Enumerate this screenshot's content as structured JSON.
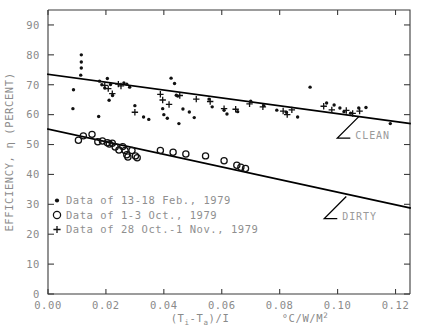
{
  "chart_data": {
    "type": "scatter",
    "title": "",
    "xlabel": "(Ti-Ta)/I",
    "xunits": "°C/W/M",
    "xunits_exp": "2",
    "ylabel": "EFFICIENCY, η (PERCENT)",
    "xlim": [
      0.0,
      0.125
    ],
    "ylim": [
      0,
      95
    ],
    "grid": false,
    "xticks": [
      0.0,
      0.02,
      0.04,
      0.06,
      0.08,
      0.1,
      0.12
    ],
    "xtick_labels": [
      "0.00",
      "0.02",
      "0.04",
      "0.06",
      "0.08",
      "0.10",
      "0.12"
    ],
    "yticks": [
      0,
      10,
      20,
      30,
      40,
      50,
      60,
      70,
      80,
      90
    ],
    "ytick_labels": [
      "0",
      "10",
      "20",
      "30",
      "40",
      "50",
      "60",
      "70",
      "80",
      "90"
    ],
    "legend_position": "lower-left-inside",
    "series": [
      {
        "name": "Data of 13-18 Feb., 1979",
        "marker": "filled-dot",
        "points": [
          [
            0.0115,
            80.0
          ],
          [
            0.0115,
            77.6
          ],
          [
            0.0115,
            75.6
          ],
          [
            0.0113,
            73.2
          ],
          [
            0.0088,
            68.3
          ],
          [
            0.0086,
            62.0
          ],
          [
            0.0178,
            71.2
          ],
          [
            0.0186,
            70.0
          ],
          [
            0.0196,
            68.9
          ],
          [
            0.0205,
            72.1
          ],
          [
            0.0216,
            70.1
          ],
          [
            0.0223,
            66.4
          ],
          [
            0.0211,
            64.8
          ],
          [
            0.0262,
            70.6
          ],
          [
            0.0272,
            70.2
          ],
          [
            0.0282,
            69.2
          ],
          [
            0.0175,
            59.4
          ],
          [
            0.03,
            63.0
          ],
          [
            0.0425,
            72.2
          ],
          [
            0.0437,
            70.4
          ],
          [
            0.0443,
            66.5
          ],
          [
            0.0396,
            62.0
          ],
          [
            0.04,
            60.0
          ],
          [
            0.0412,
            58.8
          ],
          [
            0.0452,
            57.0
          ],
          [
            0.0466,
            61.9
          ],
          [
            0.0488,
            60.9
          ],
          [
            0.0505,
            59.0
          ],
          [
            0.0448,
            66.2
          ],
          [
            0.0556,
            65.2
          ],
          [
            0.0567,
            62.6
          ],
          [
            0.0608,
            61.5
          ],
          [
            0.0618,
            60.2
          ],
          [
            0.0655,
            61.0
          ],
          [
            0.07,
            64.5
          ],
          [
            0.0745,
            63.0
          ],
          [
            0.079,
            61.5
          ],
          [
            0.0823,
            60.8
          ],
          [
            0.0862,
            59.2
          ],
          [
            0.0905,
            69.2
          ],
          [
            0.0962,
            63.9
          ],
          [
            0.0988,
            63.2
          ],
          [
            0.1008,
            62.2
          ],
          [
            0.1022,
            61.0
          ],
          [
            0.1045,
            60.5
          ],
          [
            0.1073,
            62.2
          ],
          [
            0.1098,
            62.4
          ],
          [
            0.1182,
            57.0
          ],
          [
            0.033,
            59.2
          ],
          [
            0.0348,
            58.4
          ]
        ]
      },
      {
        "name": "Data of 1-3 Oct., 1979",
        "marker": "open-circle",
        "points": [
          [
            0.0105,
            51.4
          ],
          [
            0.0122,
            52.9
          ],
          [
            0.0152,
            53.4
          ],
          [
            0.0188,
            51.2
          ],
          [
            0.0205,
            50.6
          ],
          [
            0.0212,
            50.2
          ],
          [
            0.0222,
            50.4
          ],
          [
            0.0232,
            49.2
          ],
          [
            0.0245,
            48.2
          ],
          [
            0.0258,
            49.3
          ],
          [
            0.0266,
            48.0
          ],
          [
            0.0272,
            46.6
          ],
          [
            0.0276,
            45.8
          ],
          [
            0.029,
            48.0
          ],
          [
            0.0302,
            46.2
          ],
          [
            0.0308,
            45.6
          ],
          [
            0.0388,
            48.0
          ],
          [
            0.0432,
            47.4
          ],
          [
            0.0476,
            46.8
          ],
          [
            0.0544,
            46.2
          ],
          [
            0.0608,
            44.6
          ],
          [
            0.0652,
            43.1
          ],
          [
            0.0666,
            42.4
          ],
          [
            0.0682,
            42.0
          ],
          [
            0.0172,
            50.9
          ]
        ]
      },
      {
        "name": "Data of 28 Oct.-1 Nov., 1979",
        "marker": "plus",
        "points": [
          [
            0.0196,
            69.8
          ],
          [
            0.0208,
            68.7
          ],
          [
            0.0222,
            67.0
          ],
          [
            0.0243,
            70.2
          ],
          [
            0.0252,
            69.6
          ],
          [
            0.0388,
            66.8
          ],
          [
            0.0396,
            64.9
          ],
          [
            0.0418,
            63.4
          ],
          [
            0.0455,
            66.4
          ],
          [
            0.0512,
            65.2
          ],
          [
            0.056,
            64.4
          ],
          [
            0.0608,
            62.0
          ],
          [
            0.0648,
            61.8
          ],
          [
            0.0696,
            63.6
          ],
          [
            0.0742,
            62.6
          ],
          [
            0.0812,
            61.2
          ],
          [
            0.0826,
            60.0
          ],
          [
            0.0842,
            61.6
          ],
          [
            0.0952,
            62.8
          ],
          [
            0.098,
            61.6
          ],
          [
            0.103,
            61.4
          ],
          [
            0.1052,
            60.4
          ],
          [
            0.1076,
            61.2
          ],
          [
            0.03,
            60.8
          ]
        ]
      }
    ],
    "fit_lines": [
      {
        "name": "CLEAN",
        "label": "CLEAN",
        "x0": 0.0,
        "y0": 73.5,
        "x1": 0.125,
        "y1": 57.0
      },
      {
        "name": "DIRTY",
        "label": "DIRTY",
        "x0": 0.0,
        "y0": 55.2,
        "x1": 0.125,
        "y1": 28.8
      }
    ],
    "annotations": [
      {
        "label": "CLEAN",
        "anchor_x": 0.1075,
        "anchor_y": 59.5
      },
      {
        "label": "DIRTY",
        "anchor_x": 0.103,
        "anchor_y": 32.6
      }
    ]
  },
  "legend": {
    "items": [
      {
        "marker": "filled-dot",
        "label": "Data of 13-18 Feb., 1979"
      },
      {
        "marker": "open-circle",
        "label": "Data of 1-3 Oct., 1979"
      },
      {
        "marker": "plus",
        "label": "Data of 28 Oct.-1 Nov., 1979"
      }
    ]
  },
  "colors": {
    "axis": "#3b3b3b",
    "tick_label": "#8a8a8a",
    "data": "#111111",
    "annotation": "#9a9a9a",
    "background": "#ffffff"
  }
}
